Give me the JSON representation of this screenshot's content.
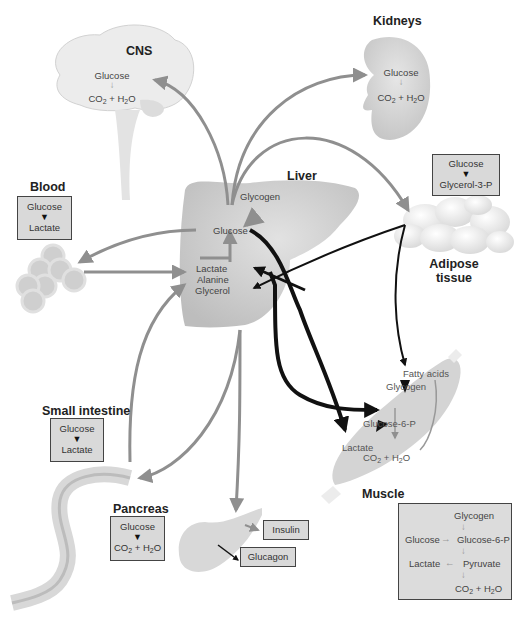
{
  "diagram": {
    "organs": {
      "cns": {
        "label": "CNS",
        "reaction": {
          "from": "Glucose",
          "to": "CO2 + H2O"
        }
      },
      "kidneys": {
        "label": "Kidneys",
        "reaction": {
          "from": "Glucose",
          "to": "CO2 + H2O"
        }
      },
      "liver": {
        "label": "Liver",
        "glycogen": "Glycogen",
        "glucose": "Glucose",
        "substrates": [
          "Lactate",
          "Alanine",
          "Glycerol"
        ]
      },
      "blood": {
        "label": "Blood",
        "reaction": {
          "from": "Glucose",
          "to": "Lactate"
        }
      },
      "adipose": {
        "label_line1": "Adipose",
        "label_line2": "tissue",
        "reaction": {
          "from": "Glucose",
          "to": "Glycerol-3-P"
        }
      },
      "small_intestine": {
        "label": "Small intestine",
        "reaction": {
          "from": "Glucose",
          "to": "Lactate"
        }
      },
      "pancreas": {
        "label": "Pancreas",
        "reaction": {
          "from": "Glucose",
          "to": "CO2 + H2O"
        },
        "hormones": [
          "Insulin",
          "Glucagon"
        ]
      },
      "muscle": {
        "label": "Muscle",
        "inside": {
          "fatty_acids": "Fatty acids",
          "glycogen": "Glycogen",
          "g6p": "Glucose-6-P",
          "lactate": "Lactate",
          "product": "CO2 + H2O"
        },
        "pathway": {
          "glycogen": "Glycogen",
          "glucose": "Glucose",
          "g6p": "Glucose-6-P",
          "lactate": "Lactate",
          "pyruvate": "Pyruvate",
          "product": "CO2 + H2O"
        }
      }
    },
    "colors": {
      "gray_arrow": "#8f8f8f",
      "black_arrow": "#111111",
      "box_fill": "#d9d9d9",
      "organ_fill": "#cfcfcf"
    }
  }
}
